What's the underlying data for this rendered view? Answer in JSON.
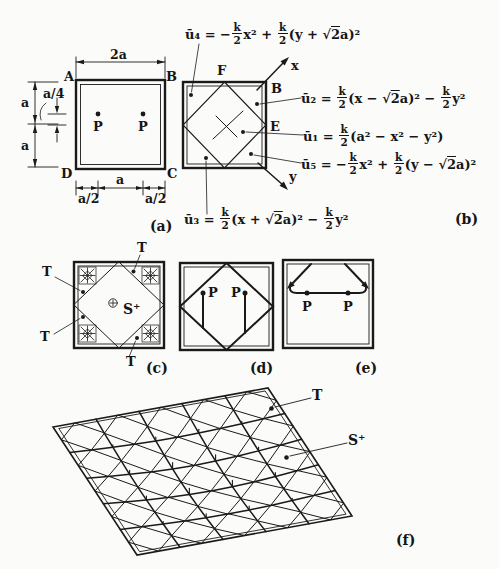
{
  "figure": {
    "ink_color": "#1a1a1a",
    "background_color": "#fbfbf9"
  },
  "panels": {
    "a": {
      "tag": "(a)",
      "corner_labels": {
        "A": "A",
        "B": "B",
        "C": "C",
        "D": "D"
      },
      "dims": {
        "top": "2a",
        "left_upper": "a",
        "left_lower": "a",
        "offset": "a/4",
        "bottom_left": "a/2",
        "bottom_mid": "a",
        "bottom_right": "a/2"
      },
      "load_labels": [
        "P",
        "P"
      ]
    },
    "b": {
      "tag": "(b)",
      "point_labels": {
        "F": "F",
        "B": "B",
        "E": "E"
      },
      "axis_labels": {
        "x": "x",
        "y": "y"
      },
      "formulas": {
        "u4": "ū₄ = −[k/2]x² + [k/2](y + √2a)²",
        "u2": "ū₂ = [k/2](x − √2a)² − [k/2]y²",
        "u1": "ū₁ = [k/2](a² − x² − y²)",
        "u5": "ū₅ = −[k/2]x² + [k/2](y − √2a)²",
        "u3": "ū₃ = [k/2](x + √2a)² − [k/2]y²"
      }
    },
    "c": {
      "tag": "(c)",
      "t_labels": [
        "T",
        "T",
        "T",
        "T"
      ],
      "center_label": "S⁺"
    },
    "d": {
      "tag": "(d)",
      "load_labels": [
        "P",
        "P"
      ]
    },
    "e": {
      "tag": "(e)",
      "load_labels": [
        "P",
        "P"
      ]
    },
    "f": {
      "tag": "(f)",
      "region_labels": {
        "t": "T",
        "s_plus": "S⁺"
      }
    }
  }
}
